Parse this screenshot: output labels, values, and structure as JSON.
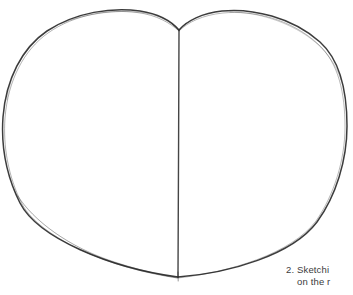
{
  "image": {
    "subject": "pencil-sketch-heart-outline",
    "background_color": "#ffffff",
    "stroke_color": "#2b2b2b",
    "width": 353,
    "height": 295
  },
  "drawing": {
    "name": "heart-outline-sketch",
    "description": "Hand-drawn pencil outline of a heart with a vertical center guideline",
    "cleft_point": {
      "x": 179,
      "y": 30
    },
    "bottom_point": {
      "x": 178,
      "y": 277
    },
    "left_extent": {
      "x": 3,
      "y": 162
    },
    "right_extent": {
      "x": 347,
      "y": 140
    },
    "left_lobe_peak": {
      "x": 110,
      "y": 13
    },
    "right_lobe_peak": {
      "x": 276,
      "y": 11
    },
    "center_line": {
      "x": 179,
      "top_y": 30,
      "bottom_y": 277
    }
  },
  "caption": {
    "line1": "2. Sketchi",
    "line2": "on the r",
    "color": "#3c3c3c"
  }
}
